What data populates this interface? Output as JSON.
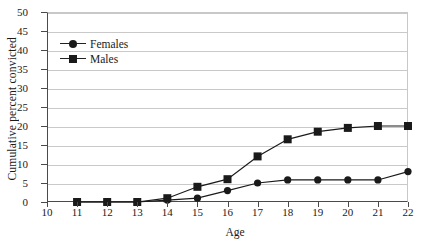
{
  "chart_data": {
    "type": "line",
    "title": "",
    "xlabel": "Age",
    "ylabel": "Cumulative percent convicted",
    "xlim": [
      10,
      22
    ],
    "ylim": [
      0,
      50
    ],
    "xticks": [
      10,
      11,
      12,
      13,
      14,
      15,
      16,
      17,
      18,
      19,
      20,
      21,
      22
    ],
    "yticks": [
      0,
      5,
      10,
      15,
      20,
      25,
      30,
      35,
      40,
      45,
      50
    ],
    "grid": "horizontal",
    "legend_position": "upper-left",
    "x": [
      11,
      12,
      13,
      14,
      15,
      16,
      17,
      18,
      19,
      20,
      21,
      22
    ],
    "series": [
      {
        "name": "Females",
        "marker": "circle",
        "color": "#1a1a1a",
        "values": [
          0,
          0,
          0,
          0.5,
          1,
          3,
          5,
          5.8,
          5.8,
          5.8,
          5.8,
          8
        ]
      },
      {
        "name": "Males",
        "marker": "square",
        "color": "#1a1a1a",
        "values": [
          0,
          0,
          0,
          1,
          4,
          6,
          12,
          16.5,
          18.5,
          19.5,
          20,
          20
        ]
      }
    ]
  },
  "legend": {
    "items": [
      {
        "label": "Females",
        "marker": "circle"
      },
      {
        "label": "Males",
        "marker": "square"
      }
    ]
  }
}
